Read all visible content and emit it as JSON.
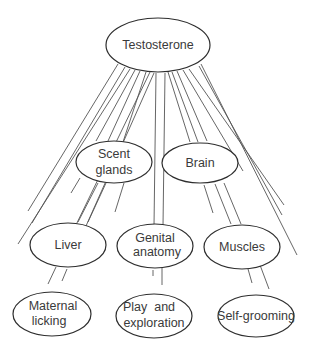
{
  "diagram": {
    "type": "hormone-influence-network",
    "colors": {
      "stroke": "#2e2e2e",
      "line": "#555555",
      "text": "#3a3a3a",
      "background": "#ffffff"
    },
    "nodes": {
      "testosterone": {
        "line1": "Testosterone"
      },
      "scent_glands": {
        "line1": "Scent",
        "line2": "glands"
      },
      "brain": {
        "line1": "Brain"
      },
      "liver": {
        "line1": "Liver"
      },
      "genital_anatomy": {
        "line1": "Genital",
        "line2": "anatomy"
      },
      "muscles": {
        "line1": "Muscles"
      },
      "maternal_licking": {
        "line1": "Maternal",
        "line2": "licking"
      },
      "play_exploration": {
        "line1": "Play  and",
        "line2": "exploration"
      },
      "self_grooming": {
        "line1": "Self-grooming"
      }
    },
    "edges": [
      {
        "from": "testosterone",
        "to": "maternal_licking"
      },
      {
        "from": "testosterone",
        "to": "liver"
      },
      {
        "from": "testosterone",
        "to": "scent_glands"
      },
      {
        "from": "testosterone",
        "to": "genital_anatomy"
      },
      {
        "from": "testosterone",
        "to": "brain"
      },
      {
        "from": "testosterone",
        "to": "muscles"
      },
      {
        "from": "testosterone",
        "to": "self_grooming"
      },
      {
        "from": "scent_glands",
        "to": "liver"
      },
      {
        "from": "scent_glands",
        "to": "genital_anatomy"
      },
      {
        "from": "brain",
        "to": "muscles"
      },
      {
        "from": "liver",
        "to": "maternal_licking"
      },
      {
        "from": "genital_anatomy",
        "to": "play_exploration"
      },
      {
        "from": "muscles",
        "to": "self_grooming"
      }
    ]
  }
}
